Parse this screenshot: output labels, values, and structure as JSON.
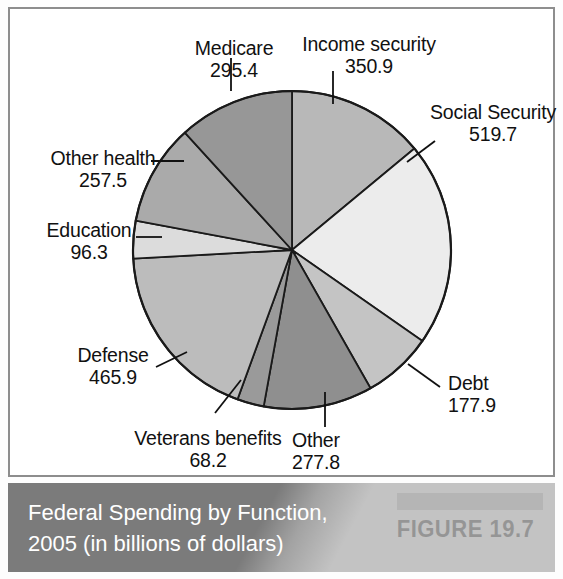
{
  "figure": {
    "caption_line1": "Federal Spending by Function,",
    "caption_line2": "2005 (in billions of dollars)",
    "figure_label": "FIGURE 19.7",
    "caption_bg": "#7b7b7b",
    "figure_rule_color": "#5c5c5c",
    "panel_border_color": "#8d8d8d"
  },
  "labels": {
    "income": {
      "name": "Income security",
      "value": "350.9"
    },
    "social": {
      "name": "Social Security",
      "value": "519.7"
    },
    "debt": {
      "name": "Debt",
      "value": "177.9"
    },
    "other": {
      "name": "Other",
      "value": "277.8"
    },
    "veterans": {
      "name": "Veterans benefits",
      "value": "68.2"
    },
    "defense": {
      "name": "Defense",
      "value": "465.9"
    },
    "education": {
      "name": "Education",
      "value": "96.3"
    },
    "otherhealth": {
      "name": "Other health",
      "value": "257.5"
    },
    "medicare": {
      "name": "Medicare",
      "value": "295.4"
    }
  },
  "chart_data": {
    "type": "pie",
    "title": "Federal Spending by Function, 2005 (in billions of dollars)",
    "units": "billions of dollars",
    "year": 2005,
    "total": 2509.6,
    "start_angle_deg": 0,
    "direction": "clockwise",
    "legend": "none (direct labels with leader lines)",
    "categories": [
      "Income security",
      "Social Security",
      "Debt",
      "Other",
      "Veterans benefits",
      "Defense",
      "Education",
      "Other health",
      "Medicare"
    ],
    "values": [
      350.9,
      519.7,
      177.9,
      277.8,
      68.2,
      465.9,
      96.3,
      257.5,
      295.4
    ],
    "slices": [
      {
        "label": "Income security",
        "value": 350.9,
        "percent": 14.0,
        "angle_deg": 50.3,
        "color": "#b8b8b8"
      },
      {
        "label": "Social Security",
        "value": 519.7,
        "percent": 20.7,
        "angle_deg": 74.6,
        "color": "#ececec"
      },
      {
        "label": "Debt",
        "value": 177.9,
        "percent": 7.1,
        "angle_deg": 25.5,
        "color": "#c4c4c4"
      },
      {
        "label": "Other",
        "value": 277.8,
        "percent": 11.1,
        "angle_deg": 39.9,
        "color": "#8f8f8f"
      },
      {
        "label": "Veterans benefits",
        "value": 68.2,
        "percent": 2.7,
        "angle_deg": 9.8,
        "color": "#9a9a9a"
      },
      {
        "label": "Defense",
        "value": 465.9,
        "percent": 18.6,
        "angle_deg": 66.8,
        "color": "#bcbcbc"
      },
      {
        "label": "Education",
        "value": 96.3,
        "percent": 3.8,
        "angle_deg": 13.8,
        "color": "#dcdcdc"
      },
      {
        "label": "Other health",
        "value": 257.5,
        "percent": 10.3,
        "angle_deg": 36.9,
        "color": "#aaaaaa"
      },
      {
        "label": "Medicare",
        "value": 295.4,
        "percent": 11.8,
        "angle_deg": 42.4,
        "color": "#979797"
      }
    ]
  }
}
